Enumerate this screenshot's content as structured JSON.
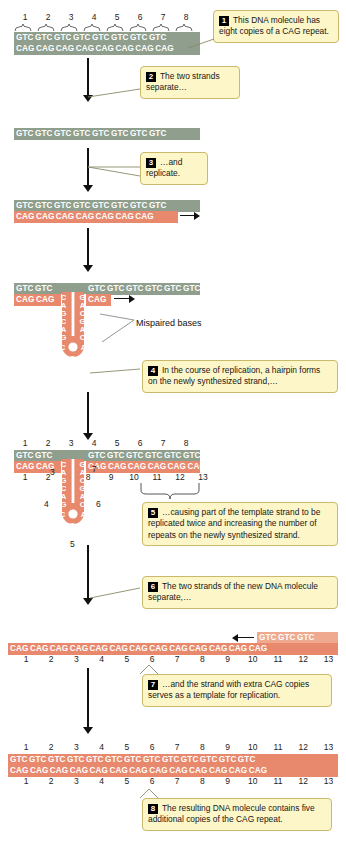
{
  "figure": {
    "colors": {
      "template_strand": "#8f9e8d",
      "new_strand": "#e8896d",
      "new_strand_light": "#eea98f",
      "callout_bg": "#fdf6c9",
      "callout_border": "#c8b96b",
      "badge_bg": "#000000"
    }
  },
  "codons": {
    "gtc": "GTC",
    "cag": "CAG"
  },
  "steps": [
    {
      "n": "1",
      "text": "This DNA molecule has eight copies of a CAG repeat."
    },
    {
      "n": "2",
      "text": "The two strands separate…"
    },
    {
      "n": "3",
      "text": "…and replicate."
    },
    {
      "n": "4",
      "text": "In the course of replication, a hairpin forms on the newly synthesized strand,…"
    },
    {
      "n": "5",
      "text": "…causing part of the template strand to be replicated twice and increasing the number of repeats on the newly synthesized strand."
    },
    {
      "n": "6",
      "text": "The two strands of the new DNA molecule separate,…"
    },
    {
      "n": "7",
      "text": "…and the strand with extra CAG copies serves as a template for replication."
    },
    {
      "n": "8",
      "text": "The resulting DNA molecule contains five additional copies of the CAG repeat."
    }
  ],
  "labels": {
    "mispaired": "Mispaired bases"
  },
  "panels": {
    "p1": {
      "name": "original-duplex",
      "top_numbers": [
        "1",
        "2",
        "3",
        "4",
        "5",
        "6",
        "7",
        "8"
      ],
      "top_strand": [
        "GTC",
        "GTC",
        "GTC",
        "GTC",
        "GTC",
        "GTC",
        "GTC",
        "GTC"
      ],
      "bottom_strand": [
        "CAG",
        "CAG",
        "CAG",
        "CAG",
        "CAG",
        "CAG",
        "CAG",
        "CAG"
      ]
    },
    "p2": {
      "name": "separated-template-strand",
      "top_strand": [
        "GTC",
        "GTC",
        "GTC",
        "GTC",
        "GTC",
        "GTC",
        "GTC",
        "GTC"
      ]
    },
    "p3": {
      "name": "replicating-duplex",
      "top_strand": [
        "GTC",
        "GTC",
        "GTC",
        "GTC",
        "GTC",
        "GTC",
        "GTC",
        "GTC"
      ],
      "bottom_strand": [
        "CAG",
        "CAG",
        "CAG",
        "CAG",
        "CAG",
        "CAG",
        "CAG"
      ]
    },
    "p4": {
      "name": "hairpin-duplex",
      "top_left": [
        "GTC",
        "GTC"
      ],
      "top_right": [
        "GTC",
        "GTC",
        "GTC",
        "GTC",
        "GTC",
        "GTC"
      ],
      "bottom_left": [
        "CAG",
        "CAG"
      ],
      "bottom_right": [
        "CAG"
      ],
      "hairpin_left": [
        "C",
        "A",
        "G",
        "C",
        "A",
        "G"
      ],
      "hairpin_right": [
        "G",
        "A",
        "C",
        "G",
        "A",
        "C"
      ],
      "loop": [
        "C",
        "A",
        "G"
      ]
    },
    "p5": {
      "name": "hairpin-duplex-numbered",
      "top_numbers": [
        "1",
        "2",
        "3",
        "4",
        "5",
        "6",
        "7",
        "8"
      ],
      "bottom_numbers": [
        "1",
        "2",
        "8",
        "9",
        "10",
        "11",
        "12",
        "13"
      ],
      "hairpin_numbers_left": [
        "3",
        "4",
        "5"
      ],
      "hairpin_numbers_right": [
        "7",
        "6"
      ],
      "top_left": [
        "GTC",
        "GTC"
      ],
      "top_right": [
        "GTC",
        "GTC",
        "GTC",
        "GTC",
        "GTC",
        "GTC"
      ],
      "bottom_left": [
        "CAG",
        "CAG"
      ],
      "bottom_right": [
        "CAG",
        "CAG",
        "CAG",
        "CAG",
        "CAG",
        "CAG"
      ],
      "hairpin_left": [
        "C",
        "A",
        "G",
        "C",
        "A",
        "G"
      ],
      "hairpin_right": [
        "G",
        "A",
        "C",
        "G",
        "A",
        "C"
      ],
      "loop": [
        "C",
        "A",
        "G"
      ]
    },
    "p6": {
      "name": "expanded-single-strand",
      "strand": [
        "CAG",
        "CAG",
        "CAG",
        "CAG",
        "CAG",
        "CAG",
        "CAG",
        "CAG",
        "CAG",
        "CAG",
        "CAG",
        "CAG",
        "CAG"
      ],
      "primer": [
        "GTC",
        "GTC",
        "GTC"
      ],
      "numbers": [
        "1",
        "2",
        "3",
        "4",
        "5",
        "6",
        "7",
        "8",
        "9",
        "10",
        "11",
        "12",
        "13"
      ]
    },
    "p7": {
      "name": "final-expanded-duplex",
      "top_numbers": [
        "1",
        "2",
        "3",
        "4",
        "5",
        "6",
        "7",
        "8",
        "9",
        "10",
        "11",
        "12",
        "13"
      ],
      "top_strand": [
        "GTC",
        "GTC",
        "GTC",
        "GTC",
        "GTC",
        "GTC",
        "GTC",
        "GTC",
        "GTC",
        "GTC",
        "GTC",
        "GTC",
        "GTC"
      ],
      "bottom_strand": [
        "CAG",
        "CAG",
        "CAG",
        "CAG",
        "CAG",
        "CAG",
        "CAG",
        "CAG",
        "CAG",
        "CAG",
        "CAG",
        "CAG",
        "CAG"
      ],
      "bottom_numbers": [
        "1",
        "2",
        "3",
        "4",
        "5",
        "6",
        "7",
        "8",
        "9",
        "10",
        "11",
        "12",
        "13"
      ]
    }
  }
}
